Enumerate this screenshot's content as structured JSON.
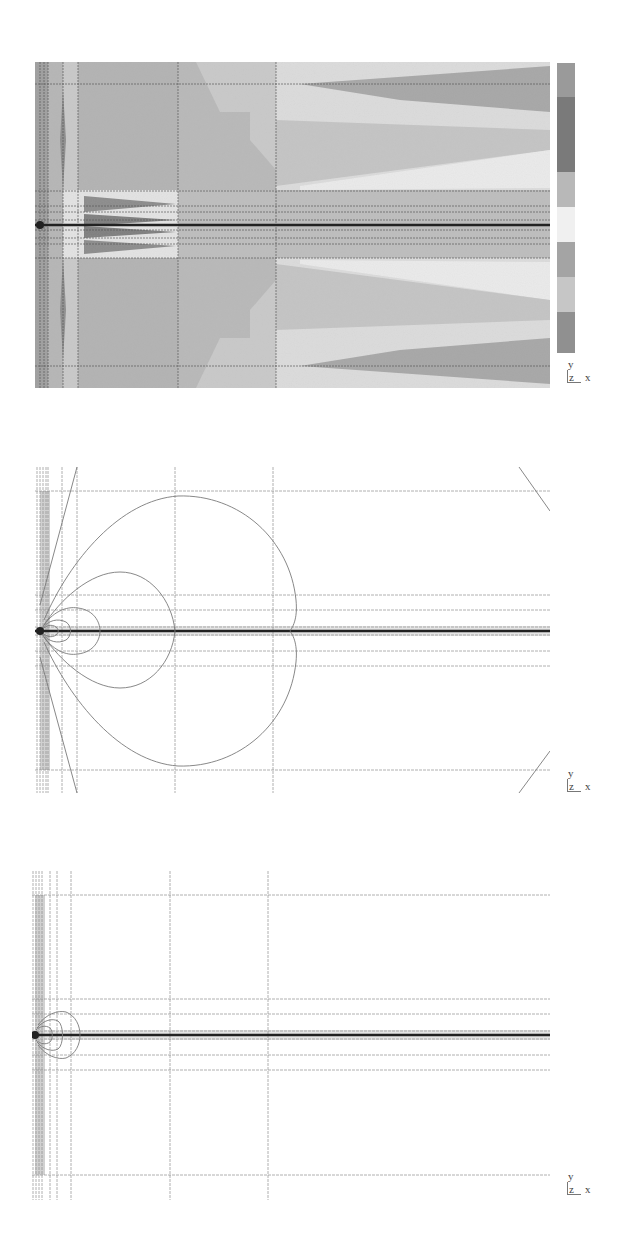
{
  "figure": {
    "width": 620,
    "height": 1260,
    "background": "#ffffff"
  },
  "panels": [
    {
      "id": "contour-field",
      "kind": "filled-contour",
      "box": {
        "x": 35,
        "y": 62,
        "w": 515,
        "h": 326
      },
      "source": {
        "x": 40,
        "y": 225
      },
      "base_fill": "#c9c9c9",
      "vertical_lines": [
        40,
        44,
        48,
        63,
        78,
        178,
        276
      ],
      "horizontal_lines": [
        84,
        191,
        206,
        212,
        220,
        225,
        230,
        238,
        244,
        258,
        366
      ],
      "bold_horizontal": 225,
      "regions": [
        {
          "name": "hourglass-top",
          "fill": "#808080",
          "points": "106,112 148,112 127,138"
        },
        {
          "name": "diamond-upper",
          "fill": "#7a7a7a",
          "points": "127,138 80,190 176,190"
        },
        {
          "name": "diamond-lower",
          "fill": "#7a7a7a",
          "points": "80,258 176,258 127,310"
        },
        {
          "name": "hourglass-bottom",
          "fill": "#808080",
          "points": "127,310 106,338 148,338"
        },
        {
          "name": "upper-left-wedge",
          "fill": "#b2b2b2",
          "points": "78,62 178,62 178,190 78,190"
        },
        {
          "name": "lower-left-wedge",
          "fill": "#b2b2b2",
          "points": "78,258 178,258 178,388 78,388"
        },
        {
          "name": "upper-block",
          "fill": "#b8b8b8",
          "points": "178,62 196,62 220,112 250,112 250,140 276,170 276,190 178,190"
        },
        {
          "name": "lower-block",
          "fill": "#b8b8b8",
          "points": "178,258 276,258 276,280 250,310 250,338 220,338 196,388 178,388"
        },
        {
          "name": "right-upper-light",
          "fill": "#dcdcdc",
          "points": "276,62 550,62 550,190 276,190"
        },
        {
          "name": "right-lower-light",
          "fill": "#dcdcdc",
          "points": "276,258 550,258 550,388 276,388"
        },
        {
          "name": "right-upper-dark-wedge",
          "fill": "#a6a6a6",
          "points": "300,84 550,66 550,112 400,100"
        },
        {
          "name": "right-upper-mid-wedge",
          "fill": "#c4c4c4",
          "points": "276,120 550,130 550,150 276,186"
        },
        {
          "name": "right-upper-white",
          "fill": "#ececec",
          "points": "300,186 550,150 550,188 300,190"
        },
        {
          "name": "right-lower-white",
          "fill": "#ececec",
          "points": "300,260 550,262 550,300 300,264"
        },
        {
          "name": "right-lower-mid-wedge",
          "fill": "#c4c4c4",
          "points": "276,264 550,300 550,320 276,330"
        },
        {
          "name": "right-lower-dark-wedge",
          "fill": "#a6a6a6",
          "points": "400,350 550,338 550,384 300,366"
        },
        {
          "name": "center-band",
          "fill": "#bdbdbd",
          "points": "178,190 550,190 550,258 178,258"
        },
        {
          "name": "left-band-light",
          "fill": "#e4e4e4",
          "points": "48,190 178,190 178,258 48,258"
        },
        {
          "name": "left-column",
          "fill": "#9e9e9e",
          "points": "35,62 48,62 48,388 35,388"
        },
        {
          "name": "left-column-2",
          "fill": "#b5b5b5",
          "points": "48,62 63,62 63,388 48,388"
        }
      ],
      "lobes": [
        {
          "name": "lobe-upper-a",
          "fill": "#8a8a8a",
          "points": "84,196 176,204 84,212"
        },
        {
          "name": "lobe-upper-b",
          "fill": "#7c7c7c",
          "points": "84,214 176,220 84,226"
        },
        {
          "name": "lobe-lower-b",
          "fill": "#7c7c7c",
          "points": "84,226 176,232 84,238"
        },
        {
          "name": "lobe-lower-a",
          "fill": "#8a8a8a",
          "points": "84,240 176,246 84,254"
        },
        {
          "name": "spindle-upper",
          "fill": "#8c8c8c",
          "points": "63,90 66,140 63,190 60,140"
        },
        {
          "name": "spindle-lower",
          "fill": "#8c8c8c",
          "points": "63,258 66,310 63,360 60,310"
        }
      ],
      "colorbar": {
        "x": 557,
        "y": 63,
        "w": 18,
        "h": 290,
        "bands": [
          {
            "fill": "#9a9a9a",
            "h": 34
          },
          {
            "fill": "#7a7a7a",
            "h": 75
          },
          {
            "fill": "#b8b8b8",
            "h": 35
          },
          {
            "fill": "#f0f0f0",
            "h": 35
          },
          {
            "fill": "#a4a4a4",
            "h": 35
          },
          {
            "fill": "#c6c6c6",
            "h": 35
          },
          {
            "fill": "#909090",
            "h": 41
          }
        ]
      },
      "triad": {
        "x": 566,
        "y": 360,
        "y_label": "y",
        "z_label": "z",
        "x_label": "x"
      }
    },
    {
      "id": "field-lines-large",
      "kind": "mesh-with-isolines",
      "box": {
        "x": 35,
        "y": 467,
        "w": 515,
        "h": 326
      },
      "source": {
        "x": 40,
        "y": 631
      },
      "vertical_lines": [
        37,
        40,
        43,
        46,
        48,
        62,
        77,
        175,
        273
      ],
      "horizontal_lines": [
        491,
        595,
        610,
        627,
        631,
        635,
        651,
        666,
        770
      ],
      "bold_horizontal": 631,
      "column_shade": {
        "x": 40,
        "w": 10,
        "y": 491,
        "h": 279
      },
      "isolines": [
        {
          "name": "isoline-large",
          "d": "M44,620 C70,560 120,500 178,496 C240,494 290,540 296,600 C298,620 292,628 290,631 C292,634 298,642 296,662 C290,722 240,768 178,766 C120,762 70,700 44,642"
        },
        {
          "name": "isoline-medium",
          "d": "M44,625 C60,600 90,572 120,572 C150,572 172,600 175,631 C172,662 150,688 120,688 C90,688 60,660 44,637"
        },
        {
          "name": "isoline-small",
          "d": "M42,628 C52,612 66,606 78,608 C94,610 100,622 100,631 C100,640 94,652 78,654 C66,656 52,650 42,634"
        },
        {
          "name": "isoline-tiny-1",
          "d": "M42,629 C48,620 58,618 66,622 C72,626 72,636 66,640 C58,644 48,642 42,633"
        },
        {
          "name": "isoline-tiny-2",
          "d": "M42,630 C46,625 52,624 56,627 C59,630 59,632 56,635 C52,638 46,637 42,632"
        },
        {
          "name": "boundary-diag-upper-left",
          "d": "M40,605 L77,467"
        },
        {
          "name": "boundary-diag-lower-left",
          "d": "M40,657 L77,793"
        },
        {
          "name": "boundary-diag-upper-right",
          "d": "M519,467 L550,511"
        },
        {
          "name": "boundary-diag-lower-right",
          "d": "M519,793 L550,751"
        }
      ],
      "triad": {
        "x": 566,
        "y": 769,
        "y_label": "y",
        "z_label": "z",
        "x_label": "x"
      }
    },
    {
      "id": "field-lines-small",
      "kind": "mesh-with-isolines",
      "box": {
        "x": 32,
        "y": 871,
        "w": 518,
        "h": 329
      },
      "source": {
        "x": 35,
        "y": 1035
      },
      "vertical_lines": [
        33,
        36,
        39,
        42,
        50,
        57,
        71,
        170,
        268
      ],
      "horizontal_lines": [
        895,
        999,
        1014,
        1031,
        1035,
        1039,
        1055,
        1070,
        1175
      ],
      "bold_horizontal": 1035,
      "column_shade": {
        "x": 35,
        "w": 10,
        "y": 895,
        "h": 280
      },
      "isolines": [
        {
          "name": "isoline-outer",
          "d": "M38,1025 C46,1014 58,1010 66,1012 C76,1016 80,1026 80,1035 C80,1044 76,1054 66,1058 C58,1060 46,1056 38,1045"
        },
        {
          "name": "isoline-mid",
          "d": "M37,1028 C44,1020 52,1018 58,1021 C64,1025 64,1045 58,1049 C52,1052 44,1050 37,1042"
        },
        {
          "name": "isoline-inner",
          "d": "M36,1030 C40,1026 46,1025 50,1028 C53,1031 53,1039 50,1042 C46,1045 40,1044 36,1040"
        }
      ],
      "triad": {
        "x": 566,
        "y": 1172,
        "y_label": "y",
        "z_label": "z",
        "x_label": "x"
      }
    }
  ]
}
